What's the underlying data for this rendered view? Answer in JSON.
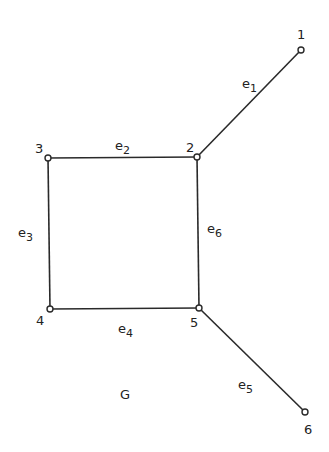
{
  "diagram": {
    "title": "G",
    "stroke_color": "#2a2a2a",
    "nodes": [
      {
        "id": "1",
        "label": "1",
        "x": 301,
        "y": 50,
        "lx": 297,
        "ly": 39
      },
      {
        "id": "2",
        "label": "2",
        "x": 197,
        "y": 157,
        "lx": 186,
        "ly": 152
      },
      {
        "id": "3",
        "label": "3",
        "x": 48,
        "y": 158,
        "lx": 35,
        "ly": 153
      },
      {
        "id": "4",
        "label": "4",
        "x": 50,
        "y": 309,
        "lx": 36,
        "ly": 325
      },
      {
        "id": "5",
        "label": "5",
        "x": 199,
        "y": 308,
        "lx": 190,
        "ly": 327
      },
      {
        "id": "6",
        "label": "6",
        "x": 305,
        "y": 412,
        "lx": 304,
        "ly": 434
      }
    ],
    "edges": [
      {
        "id": "e1",
        "name": "e",
        "sub": "1",
        "from": "2",
        "to": "1",
        "lx": 242,
        "ly": 88
      },
      {
        "id": "e2",
        "name": "e",
        "sub": "2",
        "from": "3",
        "to": "2",
        "lx": 115,
        "ly": 150
      },
      {
        "id": "e3",
        "name": "e",
        "sub": "3",
        "from": "3",
        "to": "4",
        "lx": 18,
        "ly": 237
      },
      {
        "id": "e4",
        "name": "e",
        "sub": "4",
        "from": "4",
        "to": "5",
        "lx": 118,
        "ly": 333
      },
      {
        "id": "e5",
        "name": "e",
        "sub": "5",
        "from": "5",
        "to": "6",
        "lx": 238,
        "ly": 389
      },
      {
        "id": "e6",
        "name": "e",
        "sub": "6",
        "from": "2",
        "to": "5",
        "lx": 207,
        "ly": 233
      }
    ],
    "graph_label": {
      "text": "G",
      "x": 120,
      "y": 399
    }
  }
}
